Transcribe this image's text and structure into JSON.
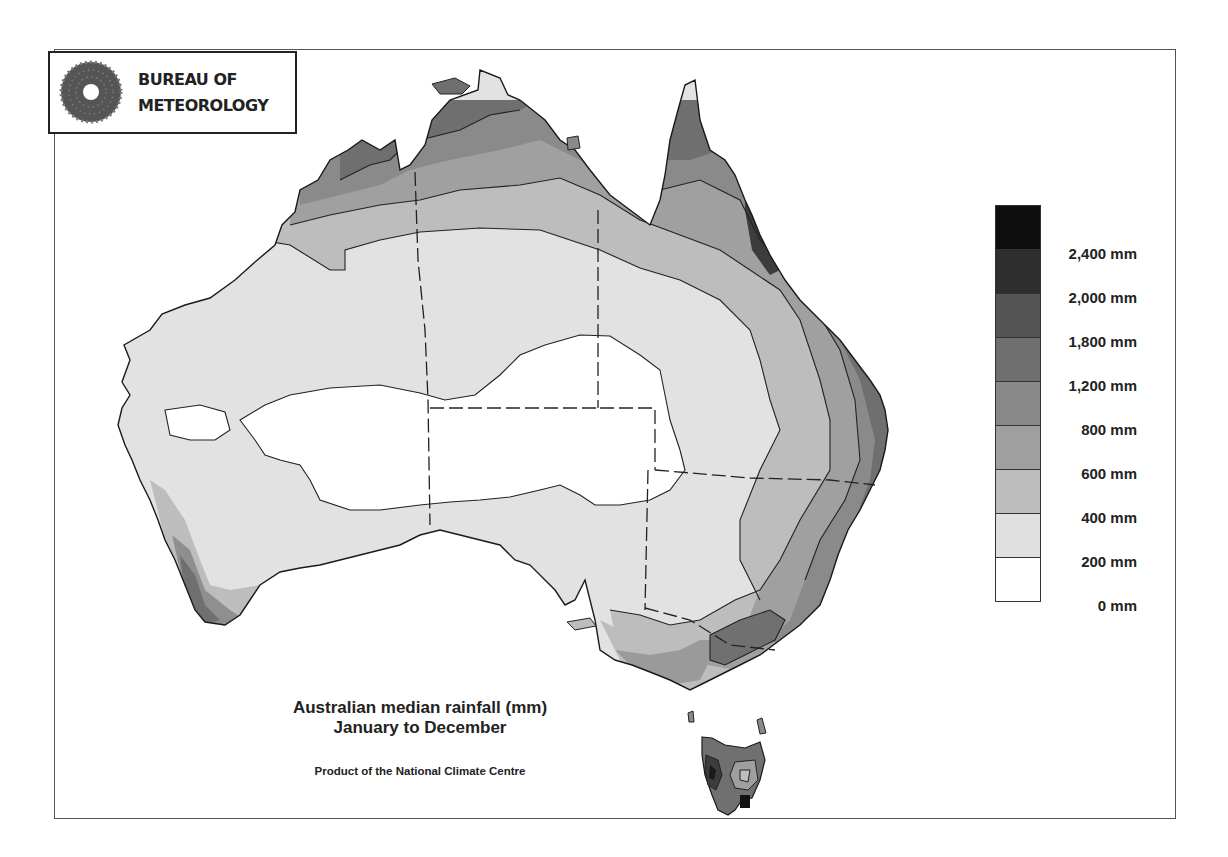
{
  "logo": {
    "line1": "BUREAU OF",
    "line2": "METEOROLOGY",
    "icon": "bureau-sunburst-icon"
  },
  "title": {
    "line1": "Australian median rainfall (mm)",
    "line2": "January to December",
    "credit": "Product of the National Climate Centre"
  },
  "legend": {
    "swatches": [
      {
        "range": "> 2,400 mm",
        "color": "#0e0e0e"
      },
      {
        "range": "2,000–2,400 mm",
        "color": "#2e2e2e"
      },
      {
        "range": "1,800–2,000 mm",
        "color": "#555555"
      },
      {
        "range": "1,200–1,800 mm",
        "color": "#6f6f6f"
      },
      {
        "range": "800–1,200 mm",
        "color": "#888888"
      },
      {
        "range": "600–800 mm",
        "color": "#9f9f9f"
      },
      {
        "range": "400–600 mm",
        "color": "#bdbdbd"
      },
      {
        "range": "200–400 mm",
        "color": "#e0e0e0"
      },
      {
        "range": "0–200 mm",
        "color": "#ffffff"
      }
    ],
    "labels": [
      "2,400 mm",
      "2,000 mm",
      "1,800 mm",
      "1,200 mm",
      "800 mm",
      "600 mm",
      "400 mm",
      "200 mm",
      "0 mm"
    ]
  },
  "chart_data": {
    "type": "choropleth-map",
    "title": "Australian median rainfall (mm)",
    "subtitle": "January to December",
    "source": "Product of the National Climate Centre",
    "region": "Australia",
    "legend_position": "right",
    "bins_mm": [
      0,
      200,
      400,
      600,
      800,
      1200,
      1800,
      2000,
      2400
    ],
    "bin_labels": [
      "0 mm",
      "200 mm",
      "400 mm",
      "600 mm",
      "800 mm",
      "1,200 mm",
      "1,800 mm",
      "2,000 mm",
      "2,400 mm"
    ],
    "regions": [
      {
        "name": "Central interior (SA/NT/WA deserts)",
        "class": "0–200 mm"
      },
      {
        "name": "Western & central inland",
        "class": "200–400 mm"
      },
      {
        "name": "Northern inland band",
        "class": "400–600 mm"
      },
      {
        "name": "Top End & Kimberley interior",
        "class": "600–800 mm"
      },
      {
        "name": "Kimberley coast / Top End coast",
        "class": "800–1,200 mm"
      },
      {
        "name": "Cape York / NE Queensland",
        "class": "1,200–1,800 mm"
      },
      {
        "name": "Wet Tropics (Cairns–Innisfail)",
        "class": "> 2,400 mm"
      },
      {
        "name": "East coast NSW",
        "class": "1,200–1,800 mm"
      },
      {
        "name": "South-west WA coast",
        "class": "800–1,200 mm"
      },
      {
        "name": "Victorian Alps",
        "class": "1,200–1,800 mm"
      },
      {
        "name": "Western Tasmania",
        "class": "2,000–2,400 mm"
      }
    ]
  }
}
